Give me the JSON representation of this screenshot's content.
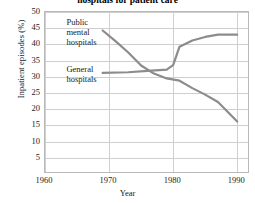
{
  "chart_data": {
    "type": "line",
    "title": "hospitals for patient care",
    "xlabel": "Year",
    "ylabel": "Inpatient episodes (%)",
    "xlim": [
      1960,
      1992
    ],
    "ylim": [
      0,
      50
    ],
    "xticks": [
      "1960",
      "1970",
      "1980",
      "1990"
    ],
    "xtick_values": [
      1960,
      1970,
      1980,
      1990
    ],
    "yticks": [
      "5",
      "10",
      "15",
      "20",
      "25",
      "30",
      "35",
      "40",
      "45",
      "50"
    ],
    "ytick_values": [
      5,
      10,
      15,
      20,
      25,
      30,
      35,
      40,
      45,
      50
    ],
    "grid": true,
    "legend_position": "inline-annotations",
    "series": [
      {
        "name": "Public mental hospitals",
        "color": "#8c8c8c",
        "x": [
          1969,
          1971,
          1973,
          1975,
          1977,
          1979,
          1981,
          1983,
          1985,
          1987,
          1990
        ],
        "values": [
          44.3,
          41.0,
          37.5,
          33.5,
          31.0,
          29.5,
          28.8,
          26.5,
          24.5,
          22.2,
          16.2
        ]
      },
      {
        "name": "General hospitals",
        "color": "#8c8c8c",
        "x": [
          1969,
          1973,
          1976,
          1979,
          1980,
          1981,
          1983,
          1985,
          1987,
          1990
        ],
        "values": [
          31.2,
          31.4,
          31.8,
          32.2,
          33.6,
          39.3,
          41.2,
          42.3,
          43.0,
          43.0
        ]
      }
    ],
    "annotations": [
      {
        "text_lines": [
          "Public",
          "mental",
          "hospitals"
        ],
        "x": 1963.5,
        "y": 48.0
      },
      {
        "text_lines": [
          "General",
          "hospitals"
        ],
        "x": 1963.5,
        "y": 33.5
      }
    ]
  }
}
